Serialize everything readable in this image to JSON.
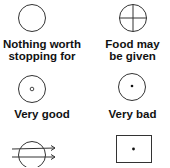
{
  "legend": {
    "items": [
      {
        "symbol": "empty-circle",
        "label_line1": "Nothing worth",
        "label_line2": "stopping for"
      },
      {
        "symbol": "circle-with-cross",
        "label_line1": "Food may",
        "label_line2": "be given"
      },
      {
        "symbol": "circle-with-small-ring",
        "label_line1": "Very good",
        "label_line2": ""
      },
      {
        "symbol": "circle-with-dot",
        "label_line1": "Very bad",
        "label_line2": ""
      },
      {
        "symbol": "circle-with-arrows",
        "label_line1": "",
        "label_line2": ""
      },
      {
        "symbol": "rectangle-with-dot",
        "label_line1": "",
        "label_line2": ""
      }
    ]
  },
  "colors": {
    "stroke": "#333333",
    "text": "#111111"
  }
}
